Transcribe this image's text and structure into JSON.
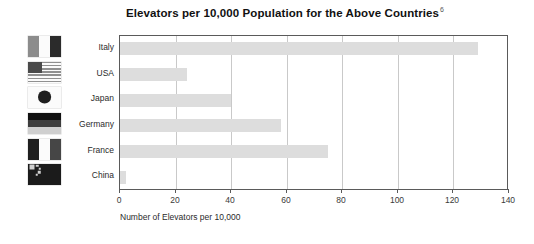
{
  "chart_data": {
    "type": "bar",
    "orientation": "horizontal",
    "title": "Elevators per 10,000 Population for the Above Countries",
    "title_footnote": "6",
    "xlabel": "Number of Elevators per 10,000",
    "ylabel": "",
    "xlim": [
      0,
      140
    ],
    "xticks": [
      0,
      20,
      40,
      60,
      80,
      100,
      120,
      140
    ],
    "xtick_labels": [
      "0",
      "20",
      "40",
      "60",
      "80",
      "100",
      "120",
      "140"
    ],
    "grid": "vertical",
    "legend": "none",
    "bar_color": "#dddddd",
    "axis_color": "#5a5a5a",
    "gridline_color": "#c9c9c9",
    "categories": [
      "Italy",
      "USA",
      "Japan",
      "Germany",
      "France",
      "China"
    ],
    "values": [
      129,
      24,
      40,
      58,
      75,
      2
    ],
    "series": [
      {
        "name": "Elevators per 10,000 Population",
        "values": [
          129,
          24,
          40,
          58,
          75,
          2
        ]
      }
    ]
  },
  "flags": [
    {
      "country": "Italy",
      "icon_name": "flag-italy-icon",
      "type": "vertical",
      "bands": [
        "#8c8c8c",
        "#fbfbfb",
        "#2b2b2b"
      ]
    },
    {
      "country": "USA",
      "icon_name": "flag-usa-icon",
      "type": "stripes",
      "bands": [
        "#909090",
        "#fbfbfb"
      ],
      "canton": "#4a4a4a"
    },
    {
      "country": "Japan",
      "icon_name": "flag-japan-icon",
      "type": "disc",
      "bands": [
        "#fbfbfb"
      ],
      "disc": "#1f1f1f"
    },
    {
      "country": "Germany",
      "icon_name": "flag-germany-icon",
      "type": "horizontal",
      "bands": [
        "#111111",
        "#3d3d3d",
        "#cfcfcf"
      ]
    },
    {
      "country": "France",
      "icon_name": "flag-france-icon",
      "type": "vertical",
      "bands": [
        "#1f1f1f",
        "#fbfbfb",
        "#464646"
      ]
    },
    {
      "country": "China",
      "icon_name": "flag-china-icon",
      "type": "stars",
      "bands": [
        "#1b1b1b"
      ],
      "star": "#cfcfcf"
    }
  ]
}
